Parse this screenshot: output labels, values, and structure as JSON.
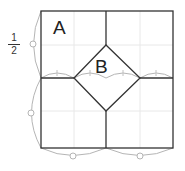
{
  "figure": {
    "regions": {
      "a_label": "A",
      "b_label": "B"
    },
    "fraction": {
      "numerator": "1",
      "denominator": "2"
    },
    "colors": {
      "line": "#333333",
      "grid": "#e6e6e6",
      "arc": "#b0b0b0"
    }
  }
}
